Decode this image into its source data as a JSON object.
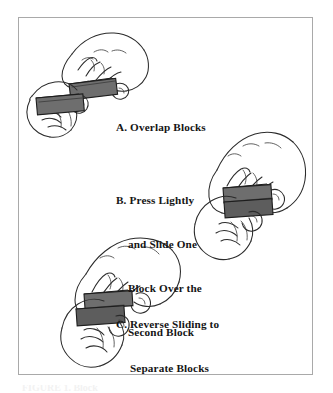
{
  "figure": {
    "background_color": "#ffffff",
    "frame_color": "#a9a9a9",
    "block_color": "#6e6e6e",
    "ink_color": "#2b2b2b",
    "bottom_strip_text": "FIGURE 1. Block"
  },
  "captions": {
    "a": {
      "label": "A.",
      "lines": [
        "A. Overlap Blocks"
      ],
      "full_text": "A. Overlap Blocks"
    },
    "b": {
      "label": "B.",
      "lines": [
        "B. Press Lightly",
        "and Slide One",
        "Block Over the",
        "Second Block"
      ],
      "full_text": "B. Press Lightly and Slide One Block Over the Second Block"
    },
    "c": {
      "label": "C.",
      "lines": [
        "C. Reverse Sliding to",
        "Separate Blocks"
      ],
      "full_text": "C. Reverse Sliding to Separate Blocks"
    }
  },
  "illustrations": {
    "a": {
      "name": "hands-overlapping-two-blocks",
      "description": "Two hands holding two grey blocks offset diagonally, partially overlapping"
    },
    "b": {
      "name": "hands-pressing-and-sliding-blocks",
      "description": "Two hands pressing lightly and sliding one block over the second, blocks fully stacked"
    },
    "c": {
      "name": "hands-reverse-sliding-blocks",
      "description": "Two hands reverse sliding the blocks apart to separate them"
    }
  }
}
